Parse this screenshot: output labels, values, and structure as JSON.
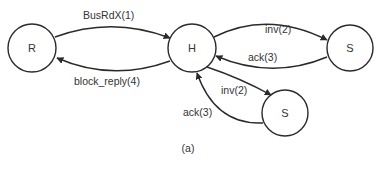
{
  "diagram": {
    "caption": "(a)",
    "nodes": [
      {
        "id": "R",
        "label": "R"
      },
      {
        "id": "H",
        "label": "H"
      },
      {
        "id": "S1",
        "label": "S"
      },
      {
        "id": "S2",
        "label": "S"
      }
    ],
    "edges": [
      {
        "id": "busrdx",
        "from": "R",
        "to": "H",
        "label": "BusRdX(1)"
      },
      {
        "id": "block-reply",
        "from": "H",
        "to": "R",
        "label": "block_reply(4)"
      },
      {
        "id": "inv-s1",
        "from": "H",
        "to": "S1",
        "label": "inv(2)"
      },
      {
        "id": "ack-s1",
        "from": "S1",
        "to": "H",
        "label": "ack(3)"
      },
      {
        "id": "inv-s2",
        "from": "H",
        "to": "S2",
        "label": "inv(2)"
      },
      {
        "id": "ack-s2",
        "from": "S2",
        "to": "H",
        "label": "ack(3)"
      }
    ],
    "colors": {
      "stroke": "#2a2a2a",
      "text": "#333333",
      "background": "#ffffff"
    }
  }
}
